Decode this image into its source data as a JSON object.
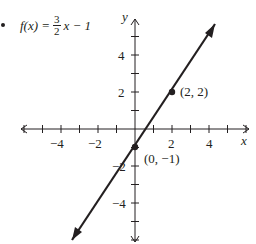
{
  "problem": {
    "bullet": "•",
    "equation": {
      "lhs": "f(x) =",
      "numerator": "3",
      "denominator": "2",
      "rhs": "x − 1"
    }
  },
  "axes": {
    "x_label": "x",
    "y_label": "y",
    "x_ticks": [
      "−4",
      "−2",
      "2",
      "4"
    ],
    "y_ticks": [
      "4",
      "2",
      "−2",
      "−4"
    ]
  },
  "points": [
    {
      "label": "(2, 2)",
      "x": 2,
      "y": 2
    },
    {
      "label": "(0, −1)",
      "x": 0,
      "y": -1
    }
  ],
  "colors": {
    "ink": "#231f20",
    "background": "#ffffff"
  },
  "chart_data": {
    "type": "line",
    "xlabel": "x",
    "ylabel": "y",
    "xlim": [
      -6.5,
      6.5
    ],
    "ylim": [
      -6,
      6.5
    ],
    "grid": false,
    "legend": null,
    "x_tick_values": [
      -6,
      -5,
      -4,
      -3,
      -2,
      -1,
      1,
      2,
      3,
      4,
      5,
      6
    ],
    "x_tick_labels": {
      "-4": "−4",
      "-2": "−2",
      "2": "2",
      "4": "4"
    },
    "y_tick_values": [
      -6,
      -5,
      -4,
      -3,
      -2,
      -1,
      1,
      2,
      3,
      4,
      5
    ],
    "y_tick_labels": {
      "4": "4",
      "2": "2",
      "-2": "−2",
      "-4": "−4"
    },
    "series": [
      {
        "name": "f(x) = 3/2 x − 1",
        "slope": 1.5,
        "intercept": -1,
        "x": [
          -3.4,
          4.3
        ],
        "y": [
          -6.1,
          5.45
        ],
        "arrows_both_ends": true
      }
    ],
    "annotations": [
      {
        "text": "(2, 2)",
        "x": 2,
        "y": 2,
        "marker": "dot"
      },
      {
        "text": "(0, −1)",
        "x": 0,
        "y": -1,
        "marker": "dot"
      }
    ]
  }
}
